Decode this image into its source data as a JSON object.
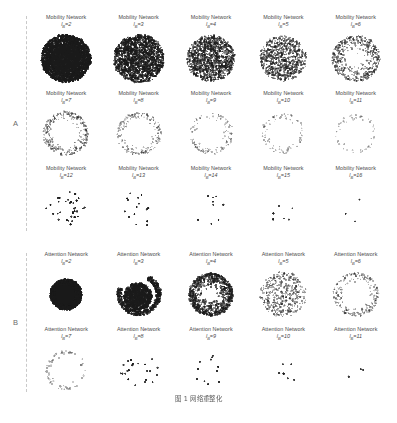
{
  "figure": {
    "caption": "图 1  网络重整化",
    "background_color": "#ffffff",
    "point_color": "#1a1a1a",
    "bracket_color": "#c9c9c9"
  },
  "sections": [
    {
      "letter": "A",
      "network_name": "Mobility Network",
      "rows": [
        [
          {
            "title": "Mobility Network",
            "var": "l",
            "sub": "B",
            "eq": "=",
            "value": "2"
          },
          {
            "title": "Mobility Network",
            "var": "l",
            "sub": "B",
            "eq": "=",
            "value": "3"
          },
          {
            "title": "Mobility Network",
            "var": "l",
            "sub": "B",
            "eq": "=",
            "value": "4"
          },
          {
            "title": "Mobility Network",
            "var": "l",
            "sub": "B",
            "eq": "=",
            "value": "5"
          },
          {
            "title": "Mobility Network",
            "var": "l",
            "sub": "B",
            "eq": "=",
            "value": "6"
          }
        ],
        [
          {
            "title": "Mobility Network",
            "var": "l",
            "sub": "B",
            "eq": "=",
            "value": "7"
          },
          {
            "title": "Mobility Network",
            "var": "l",
            "sub": "B",
            "eq": "=",
            "value": "8"
          },
          {
            "title": "Mobility Network",
            "var": "l",
            "sub": "B",
            "eq": "=",
            "value": "9"
          },
          {
            "title": "Mobility Network",
            "var": "l",
            "sub": "B",
            "eq": "=",
            "value": "10"
          },
          {
            "title": "Mobility Network",
            "var": "l",
            "sub": "B",
            "eq": "=",
            "value": "11"
          }
        ],
        [
          {
            "title": "Mobility Network",
            "var": "l",
            "sub": "B",
            "eq": "=",
            "value": "12"
          },
          {
            "title": "Mobility Network",
            "var": "l",
            "sub": "B",
            "eq": "=",
            "value": "13"
          },
          {
            "title": "Mobility Network",
            "var": "l",
            "sub": "B",
            "eq": "=",
            "value": "14"
          },
          {
            "title": "Mobility Network",
            "var": "l",
            "sub": "B",
            "eq": "=",
            "value": "15"
          },
          {
            "title": "Mobility Network",
            "var": "l",
            "sub": "B",
            "eq": "=",
            "value": "16"
          }
        ]
      ]
    },
    {
      "letter": "B",
      "network_name": "Attention Network",
      "rows": [
        [
          {
            "title": "Attention Network",
            "var": "l",
            "sub": "B",
            "eq": "=",
            "value": "2"
          },
          {
            "title": "Attention Network",
            "var": "l",
            "sub": "B",
            "eq": "=",
            "value": "3"
          },
          {
            "title": "Attention Network",
            "var": "l",
            "sub": "B",
            "eq": "=",
            "value": "4"
          },
          {
            "title": "Attention Network",
            "var": "l",
            "sub": "B",
            "eq": "=",
            "value": "5"
          },
          {
            "title": "Attention Network",
            "var": "l",
            "sub": "B",
            "eq": "=",
            "value": "6"
          }
        ],
        [
          {
            "title": "Attention Network",
            "var": "l",
            "sub": "B",
            "eq": "=",
            "value": "7"
          },
          {
            "title": "Attention Network",
            "var": "l",
            "sub": "B",
            "eq": "=",
            "value": "8"
          },
          {
            "title": "Attention Network",
            "var": "l",
            "sub": "B",
            "eq": "=",
            "value": "9"
          },
          {
            "title": "Attention Network",
            "var": "l",
            "sub": "B",
            "eq": "=",
            "value": "10"
          },
          {
            "title": "Attention Network",
            "var": "l",
            "sub": "B",
            "eq": "=",
            "value": "11"
          }
        ]
      ]
    }
  ],
  "chart_data": {
    "type": "scatter",
    "title": "图 1  网络重整化",
    "xlabel": "",
    "ylabel": "",
    "grid": false,
    "legend": "none",
    "panels": [
      {
        "section": "A",
        "network": "Mobility Network",
        "l_B": 2,
        "node_count": 2600,
        "radius": 0.8,
        "ink_density": 0.98,
        "style": "solid-disc",
        "dot_size": 1.05,
        "ring_bias": 0.0,
        "seed": 101
      },
      {
        "section": "A",
        "network": "Mobility Network",
        "l_B": 3,
        "node_count": 1850,
        "radius": 0.82,
        "ink_density": 0.72,
        "style": "dense-disc",
        "dot_size": 0.95,
        "ring_bias": 0.05,
        "seed": 102
      },
      {
        "section": "A",
        "network": "Mobility Network",
        "l_B": 4,
        "node_count": 1250,
        "radius": 0.78,
        "ink_density": 0.58,
        "style": "dense-disc",
        "dot_size": 0.92,
        "ring_bias": 0.05,
        "seed": 103
      },
      {
        "section": "A",
        "network": "Mobility Network",
        "l_B": 5,
        "node_count": 820,
        "radius": 0.76,
        "ink_density": 0.44,
        "style": "speckle-disc",
        "dot_size": 0.9,
        "ring_bias": 0.1,
        "seed": 104
      },
      {
        "section": "A",
        "network": "Mobility Network",
        "l_B": 6,
        "node_count": 520,
        "radius": 0.78,
        "ink_density": 0.34,
        "style": "core-halo",
        "dot_size": 0.88,
        "ring_bias": 0.22,
        "seed": 105
      },
      {
        "section": "A",
        "network": "Mobility Network",
        "l_B": 7,
        "node_count": 300,
        "radius": 0.74,
        "ink_density": 0.24,
        "style": "ring",
        "dot_size": 0.85,
        "ring_bias": 0.45,
        "seed": 106
      },
      {
        "section": "A",
        "network": "Mobility Network",
        "l_B": 8,
        "node_count": 190,
        "radius": 0.72,
        "ink_density": 0.18,
        "style": "ring",
        "dot_size": 0.85,
        "ring_bias": 0.52,
        "seed": 107
      },
      {
        "section": "A",
        "network": "Mobility Network",
        "l_B": 9,
        "node_count": 120,
        "radius": 0.7,
        "ink_density": 0.14,
        "style": "ring",
        "dot_size": 0.85,
        "ring_bias": 0.55,
        "seed": 108
      },
      {
        "section": "A",
        "network": "Mobility Network",
        "l_B": 10,
        "node_count": 78,
        "radius": 0.68,
        "ink_density": 0.11,
        "style": "ring",
        "dot_size": 0.85,
        "ring_bias": 0.58,
        "seed": 109
      },
      {
        "section": "A",
        "network": "Mobility Network",
        "l_B": 11,
        "node_count": 52,
        "radius": 0.66,
        "ink_density": 0.09,
        "style": "ring",
        "dot_size": 0.85,
        "ring_bias": 0.6,
        "seed": 110
      },
      {
        "section": "A",
        "network": "Mobility Network",
        "l_B": 12,
        "node_count": 34,
        "radius": 0.62,
        "ink_density": 0.07,
        "style": "sparse",
        "dot_size": 0.9,
        "ring_bias": 0.45,
        "seed": 111
      },
      {
        "section": "A",
        "network": "Mobility Network",
        "l_B": 13,
        "node_count": 16,
        "radius": 0.58,
        "ink_density": 0.05,
        "style": "sparse",
        "dot_size": 0.9,
        "ring_bias": 0.35,
        "seed": 112
      },
      {
        "section": "A",
        "network": "Mobility Network",
        "l_B": 14,
        "node_count": 9,
        "radius": 0.52,
        "ink_density": 0.04,
        "style": "sparse",
        "dot_size": 0.9,
        "ring_bias": 0.3,
        "seed": 113
      },
      {
        "section": "A",
        "network": "Mobility Network",
        "l_B": 15,
        "node_count": 6,
        "radius": 0.48,
        "ink_density": 0.03,
        "style": "sparse",
        "dot_size": 0.9,
        "ring_bias": 0.25,
        "seed": 114
      },
      {
        "section": "A",
        "network": "Mobility Network",
        "l_B": 16,
        "node_count": 3,
        "radius": 0.4,
        "ink_density": 0.02,
        "style": "sparse",
        "dot_size": 0.9,
        "ring_bias": 0.2,
        "seed": 115
      },
      {
        "section": "B",
        "network": "Attention Network",
        "l_B": 2,
        "node_count": 2200,
        "radius": 0.62,
        "ink_density": 1.0,
        "style": "solid-blob",
        "dot_size": 1.1,
        "ring_bias": 0.0,
        "seed": 201
      },
      {
        "section": "B",
        "network": "Attention Network",
        "l_B": 3,
        "node_count": 1500,
        "radius": 0.7,
        "ink_density": 0.82,
        "style": "crescent",
        "dot_size": 1.0,
        "ring_bias": 0.3,
        "seed": 202
      },
      {
        "section": "B",
        "network": "Attention Network",
        "l_B": 4,
        "node_count": 900,
        "radius": 0.72,
        "ink_density": 0.6,
        "style": "core-halo",
        "dot_size": 0.95,
        "ring_bias": 0.2,
        "seed": 203
      },
      {
        "section": "B",
        "network": "Attention Network",
        "l_B": 5,
        "node_count": 420,
        "radius": 0.76,
        "ink_density": 0.32,
        "style": "speckle-disc",
        "dot_size": 0.88,
        "ring_bias": 0.25,
        "seed": 204
      },
      {
        "section": "B",
        "network": "Attention Network",
        "l_B": 6,
        "node_count": 230,
        "radius": 0.74,
        "ink_density": 0.2,
        "style": "ring",
        "dot_size": 0.85,
        "ring_bias": 0.48,
        "seed": 205
      },
      {
        "section": "B",
        "network": "Attention Network",
        "l_B": 7,
        "node_count": 56,
        "radius": 0.66,
        "ink_density": 0.12,
        "style": "ring",
        "dot_size": 1.05,
        "ring_bias": 0.62,
        "seed": 206
      },
      {
        "section": "B",
        "network": "Attention Network",
        "l_B": 8,
        "node_count": 22,
        "radius": 0.58,
        "ink_density": 0.07,
        "style": "sparse",
        "dot_size": 0.95,
        "ring_bias": 0.4,
        "seed": 207
      },
      {
        "section": "B",
        "network": "Attention Network",
        "l_B": 9,
        "node_count": 11,
        "radius": 0.52,
        "ink_density": 0.05,
        "style": "sparse",
        "dot_size": 0.95,
        "ring_bias": 0.32,
        "seed": 208
      },
      {
        "section": "B",
        "network": "Attention Network",
        "l_B": 10,
        "node_count": 6,
        "radius": 0.46,
        "ink_density": 0.03,
        "style": "sparse",
        "dot_size": 0.95,
        "ring_bias": 0.25,
        "seed": 209
      },
      {
        "section": "B",
        "network": "Attention Network",
        "l_B": 11,
        "node_count": 3,
        "radius": 0.38,
        "ink_density": 0.02,
        "style": "sparse",
        "dot_size": 0.95,
        "ring_bias": 0.2,
        "seed": 210
      }
    ]
  }
}
